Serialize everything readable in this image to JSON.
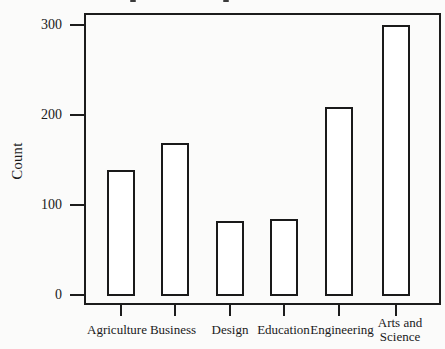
{
  "page": {
    "kind": "scanned statistics textbook bar chart",
    "background_color": "#fbfbfa",
    "ink_color": "#1a1a1a"
  },
  "chart_data": {
    "type": "bar",
    "title": "",
    "categories": [
      "Agriculture",
      "Business",
      "Design",
      "Education",
      "Engineering",
      "Arts and Science"
    ],
    "values": [
      140,
      170,
      83,
      85,
      210,
      300
    ],
    "xlabel": "",
    "ylabel": "Count",
    "yticks": [
      0,
      100,
      200,
      300
    ],
    "ytick_labels": [
      "300",
      "200",
      "100",
      "0"
    ],
    "ylim": [
      0,
      313
    ],
    "grid": false,
    "legend": "none",
    "bar_fill": "#ffffff",
    "bar_border": "#1a1a1a",
    "frame": "full box around plot area, frame extends slightly below the 0 line"
  }
}
